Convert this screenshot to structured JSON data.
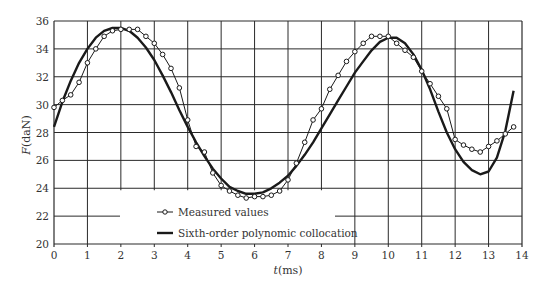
{
  "chart_data": {
    "type": "line",
    "title": "",
    "xlabel": "t(ms)",
    "ylabel": "F(daN)",
    "xlim": [
      0,
      14
    ],
    "ylim": [
      20,
      36
    ],
    "grid": true,
    "legend_position": "lower-center-left, inside plot",
    "x_ticks": [
      0,
      1,
      2,
      3,
      4,
      5,
      6,
      7,
      8,
      9,
      10,
      11,
      12,
      13,
      14
    ],
    "y_ticks": [
      20,
      22,
      24,
      26,
      28,
      30,
      32,
      34,
      36
    ],
    "series": [
      {
        "name": "Measured values",
        "style": "thin line with open circle markers",
        "x": [
          0,
          0.25,
          0.5,
          0.75,
          1.0,
          1.25,
          1.5,
          1.75,
          2.0,
          2.25,
          2.5,
          2.75,
          3.0,
          3.25,
          3.5,
          3.75,
          4.0,
          4.25,
          4.5,
          4.75,
          5.0,
          5.25,
          5.5,
          5.75,
          6.0,
          6.25,
          6.5,
          6.75,
          7.0,
          7.25,
          7.5,
          7.75,
          8.0,
          8.25,
          8.5,
          8.75,
          9.0,
          9.25,
          9.5,
          9.75,
          10.0,
          10.25,
          10.5,
          10.75,
          11.0,
          11.25,
          11.5,
          11.75,
          12.0,
          12.25,
          12.5,
          12.75,
          13.0,
          13.25,
          13.5,
          13.75
        ],
        "values": [
          29.8,
          30.3,
          30.7,
          31.6,
          33.0,
          34.0,
          34.9,
          35.3,
          35.4,
          35.4,
          35.4,
          34.9,
          34.4,
          33.6,
          32.6,
          31.2,
          28.9,
          27.0,
          26.6,
          25.1,
          24.2,
          23.8,
          23.5,
          23.3,
          23.4,
          23.4,
          23.5,
          23.8,
          24.6,
          25.8,
          27.3,
          28.9,
          29.7,
          31.1,
          32.1,
          33.1,
          33.8,
          34.4,
          34.9,
          34.9,
          34.9,
          34.4,
          33.9,
          33.4,
          32.4,
          31.5,
          30.6,
          29.7,
          27.5,
          27.1,
          26.8,
          26.6,
          27.0,
          27.4,
          27.9,
          28.4
        ]
      },
      {
        "name": "Sixth-order polynomic collocation",
        "style": "thick solid line",
        "x": [
          0,
          0.25,
          0.5,
          0.75,
          1.0,
          1.25,
          1.5,
          1.75,
          2.0,
          2.25,
          2.5,
          2.75,
          3.0,
          3.25,
          3.5,
          3.75,
          4.0,
          4.25,
          4.5,
          4.75,
          5.0,
          5.25,
          5.5,
          5.75,
          6.0,
          6.25,
          6.5,
          6.75,
          7.0,
          7.25,
          7.5,
          7.75,
          8.0,
          8.25,
          8.5,
          8.75,
          9.0,
          9.25,
          9.5,
          9.75,
          10.0,
          10.25,
          10.5,
          10.75,
          11.0,
          11.25,
          11.5,
          11.75,
          12.0,
          12.25,
          12.5,
          12.75,
          13.0,
          13.25,
          13.5,
          13.75
        ],
        "values": [
          28.4,
          30.2,
          31.7,
          33.0,
          34.0,
          34.8,
          35.3,
          35.5,
          35.5,
          35.3,
          34.8,
          34.1,
          33.2,
          32.1,
          30.9,
          29.6,
          28.4,
          27.3,
          26.3,
          25.4,
          24.7,
          24.1,
          23.8,
          23.6,
          23.6,
          23.7,
          24.0,
          24.4,
          24.9,
          25.6,
          26.4,
          27.3,
          28.3,
          29.3,
          30.3,
          31.3,
          32.3,
          33.1,
          33.9,
          34.5,
          34.8,
          34.8,
          34.4,
          33.6,
          32.5,
          31.1,
          29.5,
          28.0,
          26.8,
          25.9,
          25.3,
          25.0,
          25.2,
          26.2,
          28.1,
          31.0
        ]
      }
    ]
  },
  "axes": {
    "x_label_italic": "t",
    "x_label_unit": "(ms)",
    "y_label_italic": "F",
    "y_label_unit": "(daN)"
  },
  "legend": {
    "items": [
      {
        "label": "Measured values"
      },
      {
        "label": "Sixth-order polynomic collocation"
      }
    ]
  },
  "colors": {
    "line": "#1a1a1a",
    "grid": "#2a2a2a",
    "text": "#333333"
  }
}
